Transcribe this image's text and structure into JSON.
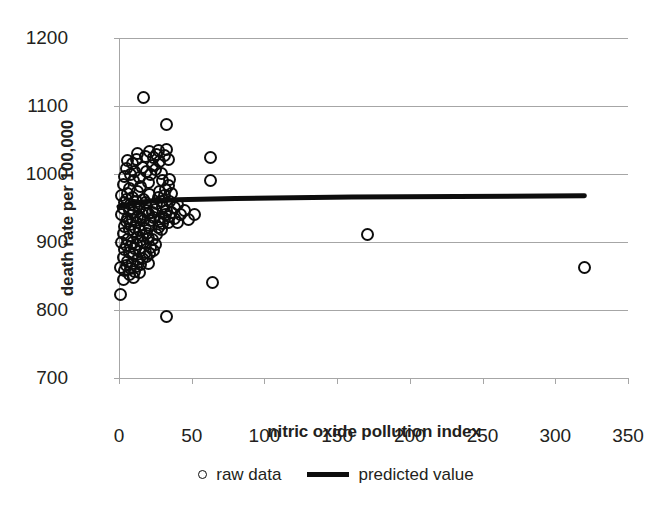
{
  "chart_data": {
    "type": "scatter",
    "title": "",
    "xlabel": "nitric oxide pollution index",
    "ylabel": "death rate per 100,000",
    "xlim": [
      0,
      350
    ],
    "ylim": [
      700,
      1200
    ],
    "xticks": [
      0,
      50,
      100,
      150,
      200,
      250,
      300,
      350
    ],
    "yticks": [
      700,
      800,
      900,
      1000,
      1100,
      1200
    ],
    "grid": "horizontal",
    "legend_position": "bottom",
    "legend": [
      {
        "label": "raw data",
        "marker": "open-circle"
      },
      {
        "label": "predicted value",
        "marker": "line"
      }
    ],
    "series": [
      {
        "name": "raw data",
        "marker": "open-circle",
        "color": "#0d0d0d",
        "points": [
          [
            1,
            823
          ],
          [
            1,
            862
          ],
          [
            2,
            900
          ],
          [
            2,
            940
          ],
          [
            2,
            968
          ],
          [
            3,
            845
          ],
          [
            3,
            877
          ],
          [
            3,
            912
          ],
          [
            3,
            950
          ],
          [
            3,
            985
          ],
          [
            4,
            858
          ],
          [
            4,
            889
          ],
          [
            4,
            923
          ],
          [
            4,
            958
          ],
          [
            4,
            997
          ],
          [
            5,
            866
          ],
          [
            5,
            895
          ],
          [
            5,
            930
          ],
          [
            5,
            962
          ],
          [
            5,
            1008
          ],
          [
            6,
            872
          ],
          [
            6,
            903
          ],
          [
            6,
            935
          ],
          [
            6,
            971
          ],
          [
            6,
            1020
          ],
          [
            7,
            852
          ],
          [
            7,
            884
          ],
          [
            7,
            918
          ],
          [
            7,
            946
          ],
          [
            7,
            978
          ],
          [
            8,
            861
          ],
          [
            8,
            893
          ],
          [
            8,
            926
          ],
          [
            8,
            955
          ],
          [
            8,
            1000
          ],
          [
            9,
            869
          ],
          [
            9,
            899
          ],
          [
            9,
            933
          ],
          [
            9,
            966
          ],
          [
            9,
            1015
          ],
          [
            10,
            848
          ],
          [
            10,
            881
          ],
          [
            10,
            915
          ],
          [
            10,
            944
          ],
          [
            10,
            990
          ],
          [
            11,
            857
          ],
          [
            11,
            890
          ],
          [
            11,
            921
          ],
          [
            11,
            953
          ],
          [
            11,
            1004
          ],
          [
            12,
            864
          ],
          [
            12,
            897
          ],
          [
            12,
            929
          ],
          [
            12,
            960
          ],
          [
            12,
            1022
          ],
          [
            13,
            874
          ],
          [
            13,
            906
          ],
          [
            13,
            938
          ],
          [
            13,
            975
          ],
          [
            13,
            1030
          ],
          [
            14,
            855
          ],
          [
            14,
            886
          ],
          [
            14,
            917
          ],
          [
            14,
            949
          ],
          [
            14,
            995
          ],
          [
            15,
            867
          ],
          [
            15,
            902
          ],
          [
            15,
            936
          ],
          [
            15,
            982
          ],
          [
            16,
            876
          ],
          [
            16,
            909
          ],
          [
            16,
            941
          ],
          [
            16,
            1010
          ],
          [
            17,
            1113
          ],
          [
            17,
            899
          ],
          [
            17,
            932
          ],
          [
            17,
            963
          ],
          [
            18,
            885
          ],
          [
            18,
            920
          ],
          [
            18,
            958
          ],
          [
            18,
            1026
          ],
          [
            19,
            878
          ],
          [
            19,
            913
          ],
          [
            19,
            947
          ],
          [
            19,
            1003
          ],
          [
            20,
            869
          ],
          [
            20,
            905
          ],
          [
            20,
            942
          ],
          [
            20,
            988
          ],
          [
            21,
            883
          ],
          [
            21,
            925
          ],
          [
            21,
            970
          ],
          [
            21,
            1033
          ],
          [
            22,
            892
          ],
          [
            22,
            931
          ],
          [
            22,
            999
          ],
          [
            23,
            904
          ],
          [
            23,
            944
          ],
          [
            23,
            1013
          ],
          [
            24,
            887
          ],
          [
            24,
            936
          ],
          [
            24,
            1024
          ],
          [
            25,
            896
          ],
          [
            25,
            948
          ],
          [
            25,
            1006
          ],
          [
            26,
            911
          ],
          [
            26,
            957
          ],
          [
            26,
            1029
          ],
          [
            27,
            921
          ],
          [
            27,
            965
          ],
          [
            27,
            1035
          ],
          [
            28,
            930
          ],
          [
            28,
            974
          ],
          [
            28,
            1018
          ],
          [
            29,
            918
          ],
          [
            29,
            959
          ],
          [
            29,
            1001
          ],
          [
            30,
            927
          ],
          [
            30,
            952
          ],
          [
            30,
            991
          ],
          [
            31,
            934
          ],
          [
            31,
            969
          ],
          [
            31,
            1027
          ],
          [
            32,
            940
          ],
          [
            32,
            977
          ],
          [
            33,
            790
          ],
          [
            33,
            1073
          ],
          [
            33,
            946
          ],
          [
            33,
            1036
          ],
          [
            34,
            928
          ],
          [
            34,
            983
          ],
          [
            34,
            1021
          ],
          [
            35,
            937
          ],
          [
            35,
            960
          ],
          [
            35,
            992
          ],
          [
            36,
            943
          ],
          [
            36,
            972
          ],
          [
            38,
            951
          ],
          [
            38,
            935
          ],
          [
            40,
            955
          ],
          [
            40,
            929
          ],
          [
            42,
            941
          ],
          [
            45,
            946
          ],
          [
            48,
            933
          ],
          [
            52,
            940
          ],
          [
            63,
            1025
          ],
          [
            63,
            990
          ],
          [
            64,
            840
          ],
          [
            171,
            911
          ],
          [
            320,
            863
          ]
        ]
      },
      {
        "name": "predicted value",
        "type": "line",
        "color": "#0d0d0d",
        "x": [
          0,
          10,
          20,
          40,
          80,
          160,
          320
        ],
        "y": [
          952,
          957,
          960,
          962,
          964,
          966,
          968
        ]
      }
    ]
  },
  "axes": {
    "y_tick_labels": [
      "1200",
      "1100",
      "1000",
      "900",
      "800",
      "700"
    ],
    "x_tick_labels": [
      "0",
      "50",
      "100",
      "150",
      "200",
      "250",
      "300",
      "350"
    ],
    "x_title": "nitric oxide pollution index",
    "y_title": "death rate per 100,000"
  },
  "legend": {
    "raw_data_label": "raw data",
    "predicted_value_label": "predicted value"
  },
  "colors": {
    "marker_stroke": "#0d0d0d",
    "gridline": "#a6a6a6",
    "text": "#231f20",
    "background": "#ffffff"
  }
}
